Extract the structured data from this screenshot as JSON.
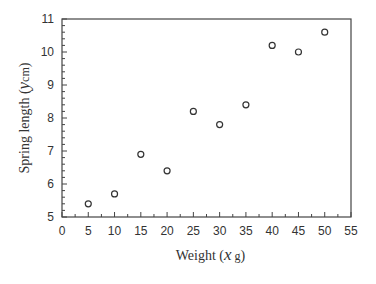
{
  "chart_data": {
    "type": "scatter",
    "title": "",
    "xlabel": "Weight",
    "xlabel_var": "x",
    "xlabel_unit": "g",
    "ylabel": "Spring length",
    "ylabel_var": "y",
    "ylabel_unit": "cm",
    "xlim": [
      0,
      55
    ],
    "ylim": [
      5,
      11
    ],
    "xticks": [
      0,
      5,
      10,
      15,
      20,
      25,
      30,
      35,
      40,
      45,
      50,
      55
    ],
    "yticks": [
      5,
      6,
      7,
      8,
      9,
      10,
      11
    ],
    "grid": false,
    "legend": null,
    "marker": "open-circle",
    "series": [
      {
        "name": "Spring length vs weight",
        "x": [
          5,
          10,
          15,
          20,
          25,
          30,
          35,
          40,
          45,
          50
        ],
        "y": [
          5.4,
          5.7,
          6.9,
          6.4,
          8.2,
          7.8,
          8.4,
          10.2,
          10.0,
          10.6
        ]
      }
    ]
  },
  "colors": {
    "axis": "#444444",
    "marker": "#333333",
    "background": "#ffffff"
  }
}
